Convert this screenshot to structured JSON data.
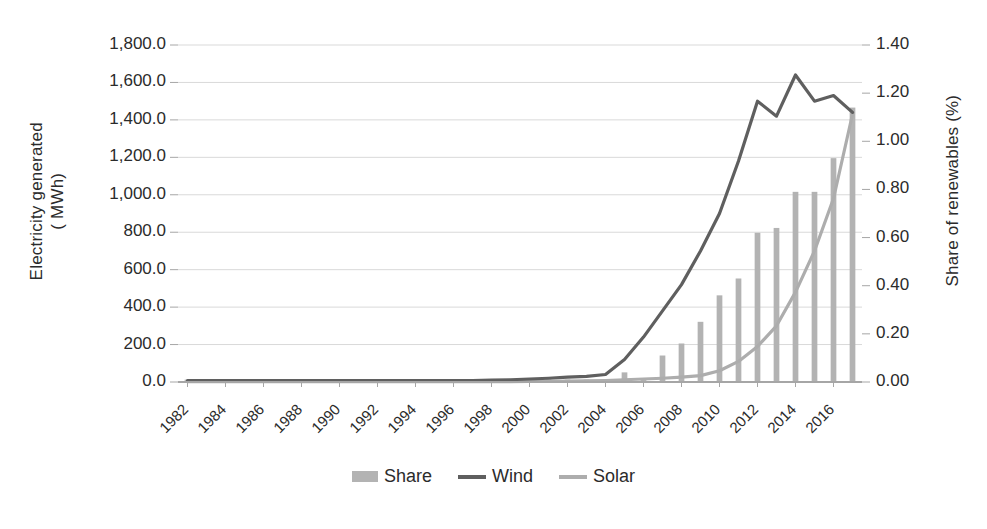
{
  "chart_data": {
    "type": "bar",
    "title": "",
    "subtitle": "",
    "xlabel": "",
    "ylabel": "Electricity generated\n( MWh)",
    "ylabel_right": "Share of renewables (%)",
    "grid": true,
    "legend_position": "bottom",
    "x": [
      1982,
      1983,
      1984,
      1985,
      1986,
      1987,
      1988,
      1989,
      1990,
      1991,
      1992,
      1993,
      1994,
      1995,
      1996,
      1997,
      1998,
      1999,
      2000,
      2001,
      2002,
      2003,
      2004,
      2005,
      2006,
      2007,
      2008,
      2009,
      2010,
      2011,
      2012,
      2013,
      2014,
      2015,
      2016,
      2017
    ],
    "xtick_labels": [
      "1982",
      "1984",
      "1986",
      "1988",
      "1990",
      "1992",
      "1994",
      "1996",
      "1998",
      "2000",
      "2002",
      "2004",
      "2006",
      "2008",
      "2010",
      "2012",
      "2014",
      "2016"
    ],
    "ylim": [
      0,
      1800
    ],
    "ytick_labels": [
      "0.0",
      "200.0",
      "400.0",
      "600.0",
      "800.0",
      "1,000.0",
      "1,200.0",
      "1,400.0",
      "1,600.0",
      "1,800.0"
    ],
    "ytick_values": [
      0,
      200,
      400,
      600,
      800,
      1000,
      1200,
      1400,
      1600,
      1800
    ],
    "ylim_right": [
      0,
      1.4
    ],
    "ytick_labels_right": [
      "0.00",
      "0.20",
      "0.40",
      "0.60",
      "0.80",
      "1.00",
      "1.20",
      "1.40"
    ],
    "ytick_values_right": [
      0,
      0.2,
      0.4,
      0.6,
      0.8,
      1.0,
      1.2,
      1.4
    ],
    "series": [
      {
        "name": "Share",
        "type": "bar",
        "axis": "right",
        "color": "#b3b3b3",
        "values": [
          0.01,
          0.01,
          0.01,
          0.01,
          0.01,
          0.01,
          0.01,
          0.01,
          0.01,
          0.01,
          0.01,
          0.01,
          0.01,
          0.01,
          0.01,
          0.01,
          0.01,
          0.01,
          0.01,
          0.01,
          0.01,
          0.01,
          0.01,
          0.04,
          0.01,
          0.11,
          0.16,
          0.25,
          0.36,
          0.43,
          0.62,
          0.64,
          0.79,
          0.79,
          0.93,
          1.14
        ]
      },
      {
        "name": "Wind",
        "type": "line",
        "axis": "left",
        "color": "#5f5f5f",
        "values": [
          8,
          8,
          8,
          8,
          8,
          8,
          8,
          8,
          8,
          8,
          8,
          8,
          8,
          8,
          8,
          8,
          10,
          12,
          16,
          20,
          26,
          30,
          40,
          120,
          240,
          380,
          520,
          700,
          900,
          1180,
          1500,
          1420,
          1640,
          1500,
          1530,
          1440
        ]
      },
      {
        "name": "Solar",
        "type": "line",
        "axis": "left",
        "color": "#adadad",
        "values": [
          2,
          2,
          2,
          2,
          2,
          2,
          2,
          2,
          2,
          2,
          2,
          2,
          2,
          2,
          2,
          2,
          2,
          2,
          3,
          4,
          5,
          6,
          8,
          12,
          16,
          20,
          26,
          34,
          60,
          110,
          190,
          300,
          480,
          700,
          980,
          1430
        ]
      }
    ]
  },
  "legend": {
    "items": [
      {
        "label": "Share",
        "marker": "bar",
        "color": "#b3b3b3"
      },
      {
        "label": "Wind",
        "marker": "line",
        "color": "#5f5f5f"
      },
      {
        "label": "Solar",
        "marker": "line",
        "color": "#adadad"
      }
    ]
  },
  "colors": {
    "share_bar": "#b3b3b3",
    "wind_line": "#5f5f5f",
    "solar_line": "#adadad",
    "gridline": "#d9d9d9",
    "axis_line": "#a6a6a6",
    "text": "#2b2b2b",
    "background": "#ffffff"
  }
}
